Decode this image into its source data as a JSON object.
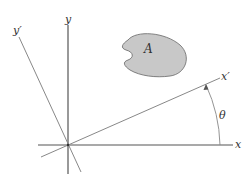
{
  "diagram": {
    "labels": {
      "y_axis": "y",
      "y_prime_axis": "y′",
      "x_axis": "x",
      "x_prime_axis": "x′",
      "area": "A",
      "angle": "θ"
    },
    "colors": {
      "axis": "#555555",
      "rotated_axis": "#888888",
      "area_fill": "#c8c8c8",
      "area_stroke": "#666666",
      "text": "#333333"
    }
  }
}
